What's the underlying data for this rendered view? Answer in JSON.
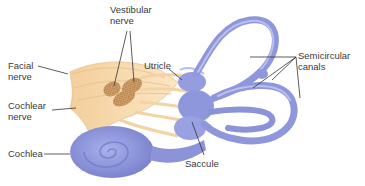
{
  "diagram": {
    "labels": {
      "vestibular_nerve": "Vestibular\nnerve",
      "facial_nerve": "Facial\nnerve",
      "utricle": "Utricle",
      "semicircular_canals": "Semicircular\ncanals",
      "cochlear_nerve": "Cochlear\nnerve",
      "cochlea": "Cochlea",
      "saccule": "Saccule"
    },
    "colors": {
      "labyrinth": "#8f97dc",
      "labyrinth_light": "#b4bbee",
      "labyrinth_dark": "#6d75c4",
      "nerve": "#f6d6a4",
      "nerve_light": "#fbe8c8",
      "nerve_dark": "#e0b27a",
      "bundle": "#c99660",
      "leader_line": "#333333",
      "text": "#3a3a3a"
    }
  }
}
